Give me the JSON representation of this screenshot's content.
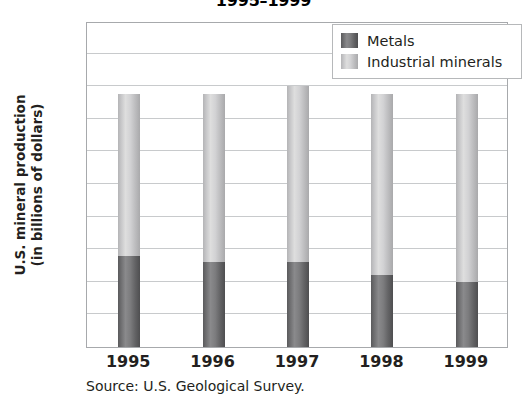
{
  "chart_data": {
    "type": "bar",
    "stacked": true,
    "title": "1995–1999",
    "xlabel": "",
    "ylabel": "U.S. mineral production (in billions of dollars)",
    "ylabel_lines": [
      "U.S. mineral production",
      "(in billions of dollars)"
    ],
    "categories": [
      "1995",
      "1996",
      "1997",
      "1998",
      "1999"
    ],
    "series": [
      {
        "name": "Metals",
        "color": "#6e6e70",
        "values": [
          14,
          13,
          13,
          11,
          10
        ]
      },
      {
        "name": "Industrial minerals",
        "color": "#d2d2d4",
        "values": [
          24.8,
          25.8,
          27,
          27.8,
          28.8
        ]
      }
    ],
    "totals": [
      38.8,
      38.8,
      40,
      38.8,
      38.8
    ],
    "ylim": [
      0,
      50
    ],
    "ytick_step": 5,
    "yticks": [
      50,
      45,
      40,
      35,
      30,
      25,
      20,
      15,
      10,
      5,
      0
    ],
    "grid": true,
    "legend_position": "top-right",
    "source": "Source: U.S. Geological Survey."
  },
  "legend": {
    "items": [
      {
        "label": "Metals"
      },
      {
        "label": "Industrial minerals"
      }
    ]
  },
  "colors": {
    "metals": "#6e6e70",
    "industrial_minerals": "#d2d2d4",
    "gridline": "#c8cacc",
    "axis": "#a7a9ac",
    "text": "#231f20"
  }
}
